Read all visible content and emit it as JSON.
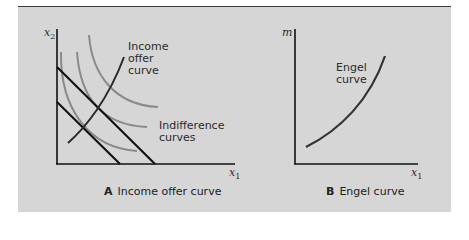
{
  "panel_a": {
    "y_axis_label": "x",
    "y_axis_sub": "2",
    "x_axis_label": "x",
    "x_axis_sub": "1",
    "income_offer_label_1": "Income",
    "income_offer_label_2": "offer",
    "income_offer_label_3": "curve",
    "indifference_label_1": "Indifference",
    "indifference_label_2": "curves",
    "caption_letter": "A",
    "caption_text": "Income offer curve"
  },
  "panel_b": {
    "y_axis_label": "m",
    "x_axis_label": "x",
    "x_axis_sub": "1",
    "engel_label_1": "Engel",
    "engel_label_2": "curve",
    "caption_letter": "B",
    "caption_text": "Engel curve"
  },
  "colors": {
    "background": "#d6d6d6",
    "axis": "#111111",
    "budget_line": "#111111",
    "offer_curve": "#2a2a2a",
    "indifference": "#8a8a8a",
    "engel_curve": "#333333"
  }
}
